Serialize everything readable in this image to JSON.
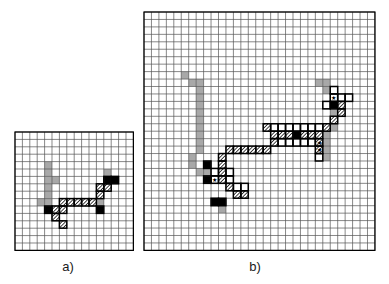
{
  "figure": {
    "type": "grid-diagram",
    "background": "#ffffff",
    "legend_colors": {
      "empty": "#ffffff",
      "gray_cell": "#a8a8a8",
      "black_cell": "#000000",
      "hatched_cell": "#ffffff",
      "hatch_stroke": "#000000",
      "grid_line": "#555555",
      "border_line": "#000000",
      "star_marker": "#000000"
    }
  },
  "panels": [
    {
      "id": "panel-a",
      "caption": "a)",
      "cols": 16,
      "rows": 16,
      "cell_size": 7.4,
      "origin_x": 14,
      "origin_y": 131,
      "gray_cells": [
        [
          4,
          4
        ],
        [
          4,
          5
        ],
        [
          4,
          6
        ],
        [
          4,
          7
        ],
        [
          4,
          8
        ],
        [
          5,
          6
        ],
        [
          3,
          9
        ],
        [
          4,
          9
        ],
        [
          12,
          5
        ],
        [
          11,
          9
        ]
      ],
      "black_cells": [
        [
          4,
          10
        ],
        [
          12,
          6
        ],
        [
          13,
          6
        ],
        [
          11,
          10
        ]
      ],
      "hatched_cells": [
        [
          5,
          10
        ],
        [
          5,
          11
        ],
        [
          6,
          9
        ],
        [
          6,
          10
        ],
        [
          7,
          9
        ],
        [
          8,
          9
        ],
        [
          9,
          9
        ],
        [
          10,
          9
        ],
        [
          6,
          12
        ],
        [
          11,
          8
        ],
        [
          11,
          7
        ],
        [
          12,
          7
        ]
      ],
      "star_cells": []
    },
    {
      "id": "panel-b",
      "caption": "b)",
      "cols": 31,
      "rows": 32,
      "cell_size": 7.45,
      "origin_x": 143,
      "origin_y": 11,
      "gray_cells": [
        [
          5,
          8
        ],
        [
          6,
          9
        ],
        [
          7,
          9
        ],
        [
          7,
          10
        ],
        [
          7,
          11
        ],
        [
          7,
          12
        ],
        [
          7,
          13
        ],
        [
          7,
          14
        ],
        [
          7,
          15
        ],
        [
          7,
          16
        ],
        [
          7,
          17
        ],
        [
          7,
          18
        ],
        [
          6,
          19
        ],
        [
          6,
          20
        ],
        [
          7,
          21
        ],
        [
          8,
          21
        ],
        [
          23,
          9
        ],
        [
          24,
          9
        ],
        [
          24,
          10
        ],
        [
          25,
          13
        ],
        [
          25,
          14
        ],
        [
          25,
          15
        ],
        [
          24,
          16
        ],
        [
          24,
          17
        ],
        [
          24,
          18
        ],
        [
          9,
          25
        ],
        [
          10,
          26
        ],
        [
          24,
          19
        ],
        [
          26,
          12
        ]
      ],
      "black_cells": [
        [
          8,
          22
        ],
        [
          20,
          16
        ],
        [
          25,
          12
        ],
        [
          9,
          25
        ],
        [
          10,
          25
        ],
        [
          8,
          20
        ]
      ],
      "hatched_cells": [
        [
          16,
          15
        ],
        [
          17,
          16
        ],
        [
          17,
          17
        ],
        [
          16,
          18
        ],
        [
          15,
          18
        ],
        [
          14,
          18
        ],
        [
          13,
          18
        ],
        [
          12,
          18
        ],
        [
          11,
          18
        ],
        [
          18,
          16
        ],
        [
          19,
          16
        ],
        [
          21,
          16
        ],
        [
          22,
          16
        ],
        [
          23,
          16
        ],
        [
          24,
          15
        ],
        [
          25,
          14
        ],
        [
          26,
          13
        ],
        [
          26,
          12
        ],
        [
          10,
          19
        ],
        [
          10,
          20
        ],
        [
          10,
          21
        ],
        [
          10,
          22
        ],
        [
          11,
          23
        ],
        [
          12,
          24
        ],
        [
          13,
          24
        ],
        [
          23,
          17
        ],
        [
          23,
          18
        ]
      ],
      "outline_cells": [
        [
          17,
          15
        ],
        [
          18,
          15
        ],
        [
          19,
          15
        ],
        [
          20,
          15
        ],
        [
          21,
          15
        ],
        [
          22,
          15
        ],
        [
          23,
          15
        ],
        [
          18,
          17
        ],
        [
          19,
          17
        ],
        [
          20,
          17
        ],
        [
          21,
          17
        ],
        [
          22,
          17
        ],
        [
          23,
          19
        ],
        [
          9,
          21
        ],
        [
          9,
          22
        ],
        [
          11,
          21
        ],
        [
          11,
          22
        ],
        [
          12,
          23
        ],
        [
          13,
          23
        ],
        [
          25,
          11
        ],
        [
          26,
          11
        ],
        [
          27,
          11
        ],
        [
          25,
          10
        ],
        [
          24,
          12
        ]
      ],
      "star_cells": [
        [
          9,
          22
        ],
        [
          23,
          17
        ],
        [
          23,
          18
        ],
        [
          25,
          11
        ]
      ]
    }
  ],
  "captions": {
    "panel_a_label": "a)",
    "panel_b_label": "b)"
  }
}
